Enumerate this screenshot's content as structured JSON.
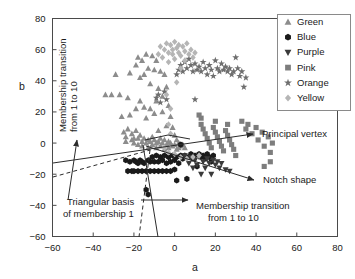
{
  "figure": {
    "background": "#ffffff",
    "frame_color": "#4a4a4a"
  },
  "chart_data": {
    "type": "scatter",
    "title": "",
    "xlabel": "a",
    "ylabel": "b",
    "xlim": [
      -60,
      80
    ],
    "ylim": [
      -60,
      80
    ],
    "xticks": [
      -60,
      -40,
      -20,
      0,
      20,
      40,
      60,
      80
    ],
    "yticks": [
      -60,
      -40,
      -20,
      0,
      20,
      40,
      60,
      80
    ],
    "xtick_labels": [
      "−60",
      "−40",
      "−20",
      "0",
      "20",
      "40",
      "60",
      "80"
    ],
    "ytick_labels": [
      "−60",
      "−40",
      "−20",
      "0",
      "20",
      "40",
      "60",
      "80"
    ],
    "grid": false,
    "legend_position": "upper-right",
    "series": [
      {
        "name": "Green",
        "marker": "triangle-up",
        "color": "#8c8c8c",
        "points": [
          [
            -34,
            31
          ],
          [
            -31,
            31
          ],
          [
            -29,
            44
          ],
          [
            -27,
            31
          ],
          [
            -26,
            17
          ],
          [
            -25,
            7
          ],
          [
            -24,
            1
          ],
          [
            -24,
            4
          ],
          [
            -23,
            29
          ],
          [
            -23,
            9
          ],
          [
            -22,
            45
          ],
          [
            -22,
            18
          ],
          [
            -21,
            2
          ],
          [
            -21,
            6
          ],
          [
            -20,
            3
          ],
          [
            -20,
            0
          ],
          [
            -19,
            50
          ],
          [
            -19,
            22
          ],
          [
            -19,
            8
          ],
          [
            -18,
            55
          ],
          [
            -18,
            3
          ],
          [
            -18,
            -1
          ],
          [
            -17,
            42
          ],
          [
            -17,
            27
          ],
          [
            -17,
            5
          ],
          [
            -16,
            53
          ],
          [
            -16,
            1
          ],
          [
            -16,
            -2
          ],
          [
            -15,
            44
          ],
          [
            -15,
            23
          ],
          [
            -15,
            3
          ],
          [
            -14,
            57
          ],
          [
            -14,
            16
          ],
          [
            -14,
            0
          ],
          [
            -13,
            48
          ],
          [
            -13,
            2
          ],
          [
            -13,
            -3
          ],
          [
            -12,
            38
          ],
          [
            -12,
            22
          ],
          [
            -12,
            1
          ],
          [
            -11,
            56
          ],
          [
            -11,
            4
          ],
          [
            -11,
            -1
          ],
          [
            -10,
            47
          ],
          [
            -10,
            19
          ],
          [
            -10,
            2
          ],
          [
            -9,
            53
          ],
          [
            -9,
            27
          ],
          [
            -9,
            0
          ],
          [
            -9,
            -3
          ],
          [
            -8,
            35
          ],
          [
            -8,
            8
          ],
          [
            -8,
            1
          ],
          [
            -7,
            46
          ],
          [
            -7,
            3
          ],
          [
            -7,
            -2
          ],
          [
            -6,
            30
          ],
          [
            -6,
            20
          ],
          [
            -6,
            0
          ],
          [
            -5,
            44
          ],
          [
            -5,
            2
          ],
          [
            -5,
            -4
          ],
          [
            -4,
            36
          ],
          [
            -4,
            11
          ],
          [
            -4,
            -1
          ],
          [
            -3,
            24
          ],
          [
            -3,
            1
          ],
          [
            -3,
            -3
          ],
          [
            -2,
            17
          ],
          [
            -2,
            0
          ],
          [
            -1,
            10
          ],
          [
            -1,
            -2
          ],
          [
            0,
            5
          ],
          [
            0,
            -1
          ],
          [
            1,
            2
          ],
          [
            1,
            -4
          ],
          [
            2,
            0
          ],
          [
            2,
            -3
          ],
          [
            3,
            -2
          ],
          [
            4,
            -1
          ],
          [
            5,
            -3
          ]
        ]
      },
      {
        "name": "Blue",
        "marker": "hexagon",
        "color": "#1a1a1a",
        "points": [
          [
            -24,
            -11
          ],
          [
            -23,
            -18
          ],
          [
            -22,
            -12
          ],
          [
            -21,
            -18
          ],
          [
            -20,
            -11
          ],
          [
            -20,
            -18
          ],
          [
            -19,
            -12
          ],
          [
            -18,
            -13
          ],
          [
            -18,
            -18
          ],
          [
            -17,
            -11
          ],
          [
            -16,
            -18
          ],
          [
            -16,
            -12
          ],
          [
            -15,
            -13
          ],
          [
            -14,
            -18
          ],
          [
            -14,
            -30
          ],
          [
            -13,
            -11
          ],
          [
            -13,
            -33
          ],
          [
            -12,
            -18
          ],
          [
            -12,
            -12
          ],
          [
            -11,
            -9
          ],
          [
            -10,
            -18
          ],
          [
            -10,
            -12
          ],
          [
            -9,
            -8
          ],
          [
            -8,
            -18
          ],
          [
            -8,
            -12
          ],
          [
            -7,
            -9
          ],
          [
            -6,
            -18
          ],
          [
            -6,
            -11
          ],
          [
            -5,
            -8
          ],
          [
            -4,
            -18
          ],
          [
            -4,
            -13
          ],
          [
            -3,
            -9
          ],
          [
            -2,
            -18
          ],
          [
            -2,
            -12
          ],
          [
            -1,
            -8
          ],
          [
            0,
            -17
          ],
          [
            0,
            -11
          ],
          [
            1,
            -24
          ],
          [
            1,
            -9
          ],
          [
            2,
            -13
          ],
          [
            3,
            -8
          ],
          [
            3,
            -1
          ],
          [
            4,
            -10
          ],
          [
            5,
            -8
          ],
          [
            6,
            -23
          ],
          [
            7,
            -9
          ],
          [
            8,
            -7
          ],
          [
            9,
            -10
          ],
          [
            10,
            -8
          ],
          [
            11,
            -15
          ],
          [
            12,
            -7
          ],
          [
            13,
            -9
          ],
          [
            14,
            -8
          ],
          [
            15,
            -10
          ],
          [
            16,
            -7
          ],
          [
            17,
            -9
          ],
          [
            18,
            -12
          ],
          [
            19,
            -8
          ]
        ]
      },
      {
        "name": "Purple",
        "marker": "triangle-down",
        "color": "#3a3a3a",
        "points": [
          [
            5,
            -8
          ],
          [
            6,
            -10
          ],
          [
            7,
            -13
          ],
          [
            8,
            -9
          ],
          [
            9,
            -16
          ],
          [
            10,
            -11
          ],
          [
            11,
            -14
          ],
          [
            12,
            -9
          ],
          [
            13,
            -20
          ],
          [
            14,
            -12
          ],
          [
            15,
            -16
          ],
          [
            16,
            -10
          ],
          [
            17,
            -13
          ],
          [
            18,
            -20
          ],
          [
            19,
            -11
          ],
          [
            20,
            -14
          ],
          [
            21,
            -12
          ],
          [
            22,
            -16
          ],
          [
            23,
            -13
          ],
          [
            25,
            -17
          ],
          [
            27,
            -18
          ]
        ]
      },
      {
        "name": "Pink",
        "marker": "square",
        "color": "#7d7d7d",
        "points": [
          [
            12,
            18
          ],
          [
            13,
            16
          ],
          [
            13,
            12
          ],
          [
            14,
            9
          ],
          [
            15,
            6
          ],
          [
            16,
            3
          ],
          [
            17,
            0
          ],
          [
            18,
            -3
          ],
          [
            19,
            10
          ],
          [
            20,
            7
          ],
          [
            20,
            14
          ],
          [
            21,
            4
          ],
          [
            22,
            1
          ],
          [
            23,
            -2
          ],
          [
            24,
            -5
          ],
          [
            25,
            8
          ],
          [
            26,
            5
          ],
          [
            26,
            12
          ],
          [
            27,
            2
          ],
          [
            28,
            -1
          ],
          [
            29,
            -4
          ],
          [
            30,
            -8
          ],
          [
            33,
            14
          ],
          [
            35,
            9
          ],
          [
            36,
            12
          ],
          [
            38,
            6
          ],
          [
            40,
            10
          ],
          [
            41,
            2
          ],
          [
            43,
            7
          ],
          [
            44,
            -2
          ],
          [
            46,
            4
          ],
          [
            47,
            -6
          ],
          [
            48,
            0
          ],
          [
            44,
            -15
          ],
          [
            47,
            -12
          ]
        ]
      },
      {
        "name": "Orange",
        "marker": "star",
        "color": "#6e6e6e",
        "points": [
          [
            -9,
            29
          ],
          [
            -8,
            31
          ],
          [
            -7,
            26
          ],
          [
            -5,
            33
          ],
          [
            -4,
            28
          ],
          [
            1,
            44
          ],
          [
            2,
            47
          ],
          [
            3,
            50
          ],
          [
            4,
            46
          ],
          [
            5,
            52
          ],
          [
            6,
            48
          ],
          [
            7,
            54
          ],
          [
            8,
            50
          ],
          [
            9,
            46
          ],
          [
            10,
            51
          ],
          [
            11,
            47
          ],
          [
            12,
            49
          ],
          [
            13,
            46
          ],
          [
            14,
            52
          ],
          [
            15,
            48
          ],
          [
            16,
            44
          ],
          [
            17,
            50
          ],
          [
            18,
            47
          ],
          [
            19,
            43
          ],
          [
            20,
            53
          ],
          [
            21,
            48
          ],
          [
            22,
            46
          ],
          [
            23,
            51
          ],
          [
            24,
            47
          ],
          [
            25,
            49
          ],
          [
            26,
            46
          ],
          [
            27,
            48
          ],
          [
            28,
            44
          ],
          [
            29,
            46
          ],
          [
            30,
            55
          ],
          [
            31,
            48
          ],
          [
            32,
            43
          ],
          [
            33,
            46
          ],
          [
            34,
            36
          ],
          [
            35,
            42
          ],
          [
            10,
            28
          ]
        ]
      },
      {
        "name": "Yellow",
        "marker": "diamond",
        "color": "#b5b5b5",
        "points": [
          [
            -8,
            57
          ],
          [
            -7,
            62
          ],
          [
            -6,
            55
          ],
          [
            -5,
            60
          ],
          [
            -4,
            64
          ],
          [
            -4,
            31
          ],
          [
            -3,
            58
          ],
          [
            -3,
            52
          ],
          [
            -2,
            63
          ],
          [
            -2,
            22
          ],
          [
            -1,
            57
          ],
          [
            -1,
            60
          ],
          [
            0,
            65
          ],
          [
            0,
            54
          ],
          [
            1,
            61
          ],
          [
            1,
            39
          ],
          [
            2,
            58
          ],
          [
            2,
            63
          ],
          [
            3,
            56
          ],
          [
            3,
            48
          ],
          [
            4,
            62
          ],
          [
            5,
            59
          ],
          [
            5,
            53
          ],
          [
            6,
            64
          ],
          [
            7,
            57
          ],
          [
            8,
            60
          ],
          [
            9,
            55
          ],
          [
            10,
            58
          ],
          [
            -3,
            12
          ],
          [
            -2,
            6
          ],
          [
            -5,
            -3
          ],
          [
            -3,
            -6
          ],
          [
            0,
            -7
          ],
          [
            3,
            -9
          ],
          [
            6,
            -10
          ],
          [
            9,
            -9
          ],
          [
            12,
            -8
          ]
        ]
      }
    ]
  },
  "legend": {
    "items": [
      {
        "label": "Green",
        "marker": "triangle-up",
        "color": "#8c8c8c"
      },
      {
        "label": "Blue",
        "marker": "hexagon",
        "color": "#1a1a1a"
      },
      {
        "label": "Purple",
        "marker": "triangle-down",
        "color": "#3a3a3a"
      },
      {
        "label": "Pink",
        "marker": "square",
        "color": "#7d7d7d"
      },
      {
        "label": "Orange",
        "marker": "star",
        "color": "#6e6e6e"
      },
      {
        "label": "Yellow",
        "marker": "diamond",
        "color": "#b5b5b5"
      }
    ]
  },
  "annotations": [
    {
      "id": "membership-transition-left",
      "line1": "Membership transition",
      "line2": "from 1 to 10",
      "orientation": "vertical"
    },
    {
      "id": "triangular-basis",
      "line1": "Triangular basis",
      "line2": "of membership 1",
      "orientation": "horizontal"
    },
    {
      "id": "membership-transition-bottom",
      "line1": "Membership transition",
      "line2": "from 1 to 10",
      "orientation": "horizontal"
    },
    {
      "id": "principal-vertex",
      "line1": "Principal vertex",
      "orientation": "horizontal"
    },
    {
      "id": "notch-shape",
      "line1": "Notch shape",
      "orientation": "horizontal"
    }
  ]
}
